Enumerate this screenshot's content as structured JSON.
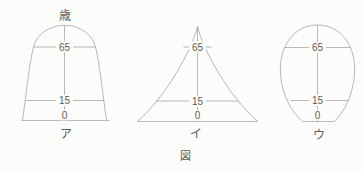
{
  "figure": {
    "caption": "図",
    "axis_unit_label": "歳",
    "colors": {
      "background": "#fcfcfa",
      "line": "#a6a5a0",
      "text": "#5f5d57"
    },
    "pyramids": [
      {
        "name_label": "ア",
        "age_ticks": {
          "age65": "65",
          "age15": "15",
          "age0": "0"
        }
      },
      {
        "name_label": "イ",
        "age_ticks": {
          "age65": "65",
          "age15": "15",
          "age0": "0"
        }
      },
      {
        "name_label": "ウ",
        "age_ticks": {
          "age65": "65",
          "age15": "15",
          "age0": "0"
        }
      }
    ]
  }
}
